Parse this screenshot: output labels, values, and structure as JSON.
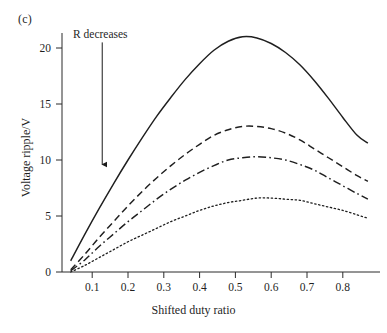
{
  "figure": {
    "panel_label": "(c)",
    "annotation": {
      "text": "R decreases",
      "arrow": "down-arrow",
      "x_position": 0.128,
      "y_start": 20.5,
      "y_end": 9.6
    }
  },
  "chart_data": {
    "type": "line",
    "title": "",
    "xlabel": "Shifted duty ratio",
    "ylabel": "Voltage ripple/V",
    "xlim": [
      0.035,
      0.87
    ],
    "ylim": [
      0,
      22.5
    ],
    "grid": false,
    "legend": "none",
    "xticks": [
      0.1,
      0.2,
      0.3,
      0.4,
      0.5,
      0.6,
      0.7,
      0.8
    ],
    "xtick_labels": [
      "0.1",
      "0.2",
      "0.3",
      "0.4",
      "0.5",
      "0.6",
      "0.7",
      "0.8"
    ],
    "yticks": [
      0,
      5,
      10,
      15,
      20
    ],
    "ytick_labels": [
      "0",
      "5",
      "10",
      "15",
      "20"
    ],
    "x": [
      0.04,
      0.08,
      0.12,
      0.16,
      0.2,
      0.24,
      0.28,
      0.32,
      0.36,
      0.4,
      0.44,
      0.48,
      0.52,
      0.56,
      0.6,
      0.64,
      0.68,
      0.72,
      0.76,
      0.8,
      0.84,
      0.87
    ],
    "series": [
      {
        "name": "curve-1-solid",
        "style": "solid",
        "peak_x": 0.52,
        "peak_y": 21.0,
        "values": [
          1.0,
          3.4,
          5.7,
          7.9,
          10.0,
          12.0,
          13.9,
          15.6,
          17.2,
          18.6,
          19.8,
          20.6,
          21.0,
          20.9,
          20.4,
          19.6,
          18.5,
          17.1,
          15.5,
          13.8,
          12.2,
          11.5
        ]
      },
      {
        "name": "curve-2-dashed",
        "style": "dashed",
        "peak_x": 0.53,
        "peak_y": 13.0,
        "values": [
          0.2,
          1.6,
          3.1,
          4.5,
          5.9,
          7.2,
          8.4,
          9.5,
          10.5,
          11.4,
          12.2,
          12.7,
          13.0,
          13.0,
          12.8,
          12.4,
          11.8,
          11.0,
          10.2,
          9.4,
          8.6,
          8.1
        ]
      },
      {
        "name": "curve-3-dashdot",
        "style": "dashdot",
        "peak_x": 0.55,
        "peak_y": 10.3,
        "values": [
          0.1,
          1.1,
          2.3,
          3.4,
          4.5,
          5.5,
          6.5,
          7.4,
          8.2,
          8.9,
          9.5,
          10.0,
          10.2,
          10.3,
          10.2,
          10.0,
          9.6,
          9.1,
          8.4,
          7.7,
          7.0,
          6.5
        ]
      },
      {
        "name": "curve-4-dotted",
        "style": "dotted",
        "peak_x": 0.57,
        "peak_y": 6.6,
        "values": [
          0.0,
          0.6,
          1.3,
          2.0,
          2.7,
          3.3,
          3.9,
          4.5,
          5.0,
          5.5,
          5.9,
          6.2,
          6.4,
          6.6,
          6.6,
          6.5,
          6.4,
          6.1,
          5.8,
          5.5,
          5.1,
          4.8
        ]
      }
    ]
  }
}
